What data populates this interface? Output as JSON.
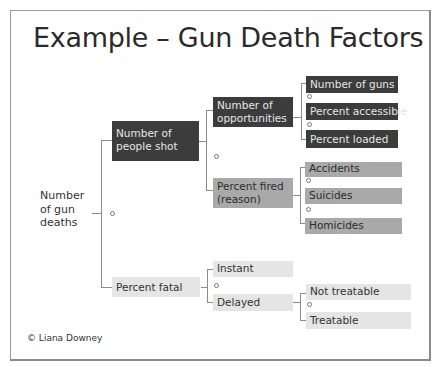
{
  "title": "Example – Gun Death Factors",
  "credit": "© Liana Downey",
  "tree": {
    "root": "Number of gun deaths",
    "root_lines": [
      "Number",
      "of gun",
      "deaths"
    ],
    "level1": [
      {
        "label": "Number of people shot",
        "lines": [
          "Number of",
          "people shot"
        ]
      },
      {
        "label": "Percent fatal"
      }
    ],
    "level2": [
      {
        "label": "Number of opportunities",
        "lines": [
          "Number of",
          "opportunities"
        ]
      },
      {
        "label": "Percent fired (reason)",
        "lines": [
          "Percent fired",
          "(reason)"
        ]
      },
      {
        "label": "Instant"
      },
      {
        "label": "Delayed"
      }
    ],
    "level3": [
      {
        "label": "Number of guns"
      },
      {
        "label": "Percent accessible"
      },
      {
        "label": "Percent loaded"
      },
      {
        "label": "Accidents"
      },
      {
        "label": "Suicides"
      },
      {
        "label": "Homicides"
      },
      {
        "label": "Not treatable"
      },
      {
        "label": "Treatable"
      }
    ]
  },
  "operator_symbol": "×",
  "colors": {
    "dark_fill": "#3c3c3c",
    "mid_fill": "#a9a9a9",
    "light_fill": "#e5e5e5",
    "connector": "#8c8c8c"
  }
}
